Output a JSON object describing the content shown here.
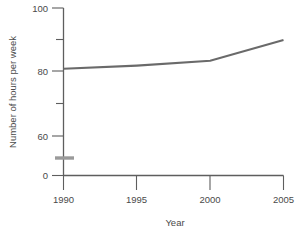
{
  "chart_data": {
    "type": "line",
    "title": "",
    "xlabel": "Year",
    "ylabel": "Number of hours per week",
    "x": [
      1990,
      1995,
      2000,
      2005
    ],
    "values": [
      81,
      82,
      83.5,
      90
    ],
    "series": [
      {
        "name": "Number of hours per week",
        "values": [
          81,
          82,
          83.5,
          90
        ]
      }
    ],
    "x_ticks": [
      "1990",
      "1995",
      "2000",
      "2005"
    ],
    "y_ticks": [
      "0",
      "60",
      "80",
      "100"
    ],
    "y_minor_ticks": [
      70,
      90
    ],
    "xlim": [
      1990,
      2005
    ],
    "ylim": [
      0,
      100
    ],
    "grid": false,
    "legend": false,
    "axis_break": {
      "axis": "y",
      "between": [
        0,
        60
      ],
      "symbol": "break-bar"
    },
    "colors": {
      "line": "#6a6a6a",
      "axis": "#5e5e5e",
      "text": "#4a4a4a",
      "break_bar": "#9a9a9a",
      "background": "#ffffff"
    }
  },
  "x_tick_labels": {
    "t0": "1990",
    "t1": "1995",
    "t2": "2000",
    "t3": "2005"
  },
  "y_tick_labels": {
    "t0": "100",
    "t1": "80",
    "t2": "60",
    "t3": "0"
  },
  "axis_titles": {
    "x": "Year",
    "y": "Number of hours per week"
  }
}
